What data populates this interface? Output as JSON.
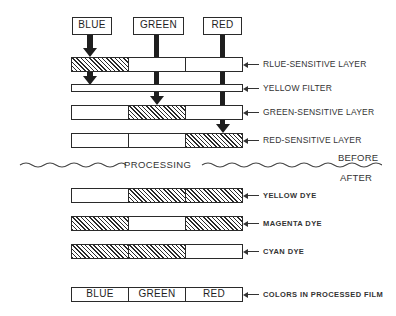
{
  "diagram": {
    "light_sources": [
      {
        "label": "BLUE",
        "target_layer": "blue-sensitive"
      },
      {
        "label": "GREEN",
        "target_layer": "green-sensitive"
      },
      {
        "label": "RED",
        "target_layer": "red-sensitive"
      }
    ],
    "before_layers": [
      {
        "label": "RLUE-SENSITIVE LAYER",
        "exposed": [
          true,
          false,
          false
        ]
      },
      {
        "label": "YELLOW FILTER",
        "type": "filter"
      },
      {
        "label": "GREEN-SENSITIVE LAYER",
        "exposed": [
          false,
          true,
          false
        ]
      },
      {
        "label": "RED-SENSITIVE LAYER",
        "exposed": [
          false,
          false,
          true
        ]
      }
    ],
    "divider": {
      "label": "PROCESSING",
      "before_label": "BEFORE",
      "after_label": "AFTER"
    },
    "after_layers": [
      {
        "label": "YELLOW DYE",
        "dye": [
          false,
          true,
          true
        ]
      },
      {
        "label": "MAGENTA DYE",
        "dye": [
          true,
          false,
          true
        ]
      },
      {
        "label": "CYAN DYE",
        "dye": [
          true,
          true,
          false
        ]
      }
    ],
    "result": {
      "cells": [
        "BLUE",
        "GREEN",
        "RED"
      ],
      "label": "COLORS IN PROCESSED FILM"
    }
  }
}
